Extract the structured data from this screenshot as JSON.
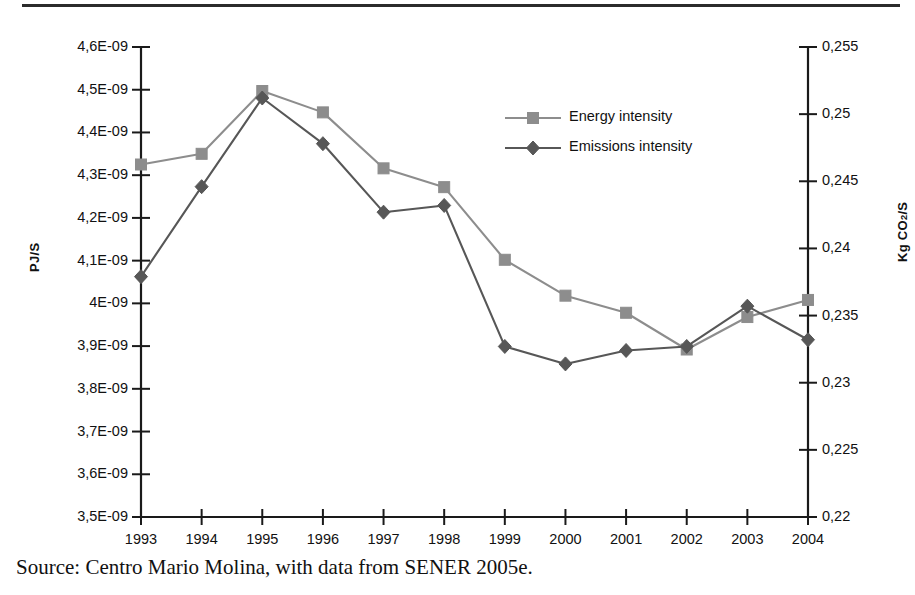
{
  "caption": "Source: Centro Mario Molina, with data from SENER 2005e.",
  "axes": {
    "left_title_main": "PJ/S",
    "right_title_prefix": "Kg CO",
    "right_title_sub": "2",
    "right_title_suffix": "/S",
    "left_ticks": [
      "4,6E-09",
      "4,5E-09",
      "4,4E-09",
      "4,3E-09",
      "4,2E-09",
      "4,1E-09",
      "4E-09",
      "3,9E-09",
      "3,8E-09",
      "3,7E-09",
      "3,6E-09",
      "3,5E-09"
    ],
    "right_ticks": [
      "0,255",
      "0,25",
      "0,245",
      "0,24",
      "0,235",
      "0,23",
      "0,225",
      "0,22"
    ],
    "x_ticks": [
      "1993",
      "1994",
      "1995",
      "1996",
      "1997",
      "1998",
      "1999",
      "2000",
      "2001",
      "2002",
      "2003",
      "2004"
    ]
  },
  "legend": {
    "items": [
      {
        "label": "Energy intensity",
        "marker": "square",
        "color": "#8d8d8d"
      },
      {
        "label": "Emissions intensity",
        "marker": "diamond",
        "color": "#575757"
      }
    ]
  },
  "colors": {
    "energy": "#8d8d8d",
    "emissions": "#575757",
    "axis": "#1a1a1a",
    "background": "#ffffff"
  },
  "chart_data": {
    "type": "line",
    "title": "",
    "xlabel": "",
    "ylabel": "PJ/S",
    "y2label": "Kg CO2/S",
    "grid": false,
    "legend_position": "inside-top-right",
    "x": [
      "1993",
      "1994",
      "1995",
      "1996",
      "1997",
      "1998",
      "1999",
      "2000",
      "2001",
      "2002",
      "2003",
      "2004"
    ],
    "ylim": [
      3.5e-09,
      4.6e-09
    ],
    "y2lim": [
      0.22,
      0.255
    ],
    "ytick_step": 1e-10,
    "y2tick_step": 0.005,
    "series": [
      {
        "name": "Energy intensity",
        "axis": "left",
        "marker": "square",
        "color": "#8d8d8d",
        "values": [
          4.325e-09,
          4.35e-09,
          4.497e-09,
          4.447e-09,
          4.316e-09,
          4.272e-09,
          4.102e-09,
          4.018e-09,
          3.978e-09,
          3.892e-09,
          3.968e-09,
          4.008e-09
        ]
      },
      {
        "name": "Emissions intensity",
        "axis": "right",
        "marker": "diamond",
        "color": "#575757",
        "values": [
          0.2379,
          0.2446,
          0.2512,
          0.2478,
          0.2427,
          0.2432,
          0.2327,
          0.2314,
          0.2324,
          0.2327,
          0.2357,
          0.2332
        ]
      }
    ]
  }
}
